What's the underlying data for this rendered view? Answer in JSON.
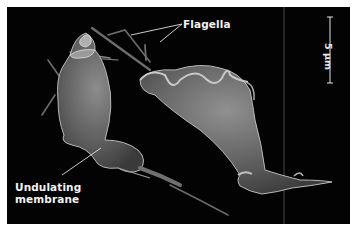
{
  "figure": {
    "background_color": "#030303",
    "labels": {
      "flagella": "Flagella",
      "undulating_membrane_line1": "Undulating",
      "undulating_membrane_line2": "membrane"
    },
    "scale_bar": {
      "text": "5 µm",
      "orientation": "vertical"
    },
    "colors": {
      "label_text": "#f2f2f2",
      "pointer_line": "#e0e0e0",
      "cell_body": "#7a7a7a"
    }
  }
}
